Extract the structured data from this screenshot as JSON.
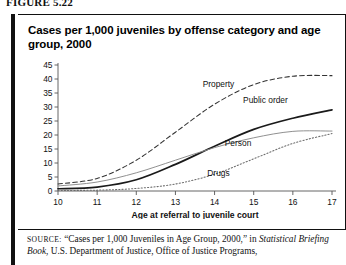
{
  "figure": {
    "label": "FIGURE 5.22"
  },
  "panel": {
    "title": "Cases per 1,000 juveniles by offense category and age group, 2000"
  },
  "source": {
    "prefix": "SOURCE:",
    "quoted": "“Cases per 1,000 Juveniles in Age Group, 2000,”",
    "in_word": "in",
    "publication": "Statistical Briefing Book",
    "rest": ", U.S. Department of Justice, Office of Justice Programs,"
  },
  "chart_data": {
    "type": "line",
    "title": "Cases per 1,000 juveniles by offense category and age group, 2000",
    "xlabel": "Age at referral to juvenile court",
    "ylabel": "",
    "x": [
      10,
      11,
      12,
      13,
      14,
      15,
      16,
      17
    ],
    "xlim": [
      10,
      17
    ],
    "ylim": [
      0,
      45
    ],
    "ytick_labels": [
      "0",
      "5",
      "10",
      "15",
      "20",
      "25",
      "30",
      "35",
      "40",
      "45"
    ],
    "yticks": [
      0,
      5,
      10,
      15,
      20,
      25,
      30,
      35,
      40,
      45
    ],
    "xtick_labels": [
      "10",
      "11",
      "12",
      "13",
      "14",
      "15",
      "16",
      "17"
    ],
    "grid": false,
    "legend": "inline-annotations",
    "series": [
      {
        "name": "Property",
        "style": "dashed",
        "color": "#333333",
        "values": [
          2.5,
          4.5,
          11.0,
          21.0,
          31.0,
          38.0,
          41.0,
          41.2
        ],
        "label_x": 14.1,
        "label_y": 37.0
      },
      {
        "name": "Public order",
        "style": "solid-bold",
        "color": "#1a1a1a",
        "values": [
          0.8,
          1.4,
          4.0,
          9.5,
          16.0,
          22.0,
          26.0,
          29.0
        ],
        "label_x": 15.3,
        "label_y": 31.5
      },
      {
        "name": "Person",
        "style": "solid-thin",
        "color": "#8a8a8a",
        "values": [
          1.8,
          3.2,
          6.5,
          11.0,
          15.5,
          19.0,
          21.3,
          21.4
        ],
        "label_x": 14.6,
        "label_y": 16.0
      },
      {
        "name": "Drugs",
        "style": "dotted",
        "color": "#6b6b6b",
        "values": [
          0.2,
          0.3,
          0.9,
          2.5,
          6.0,
          11.5,
          17.0,
          20.5
        ],
        "label_x": 14.1,
        "label_y": 5.5
      }
    ]
  }
}
